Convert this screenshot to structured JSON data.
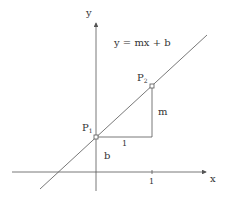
{
  "diagram": {
    "equation": "y = mx + b",
    "axes": {
      "x_label": "x",
      "y_label": "y",
      "x_tick_label": "1"
    },
    "points": [
      {
        "name": "P",
        "sub": "1"
      },
      {
        "name": "P",
        "sub": "2"
      }
    ],
    "labels": {
      "run": "1",
      "rise": "m",
      "intercept": "b"
    },
    "colors": {
      "stroke": "#555555",
      "text": "#333333"
    }
  }
}
